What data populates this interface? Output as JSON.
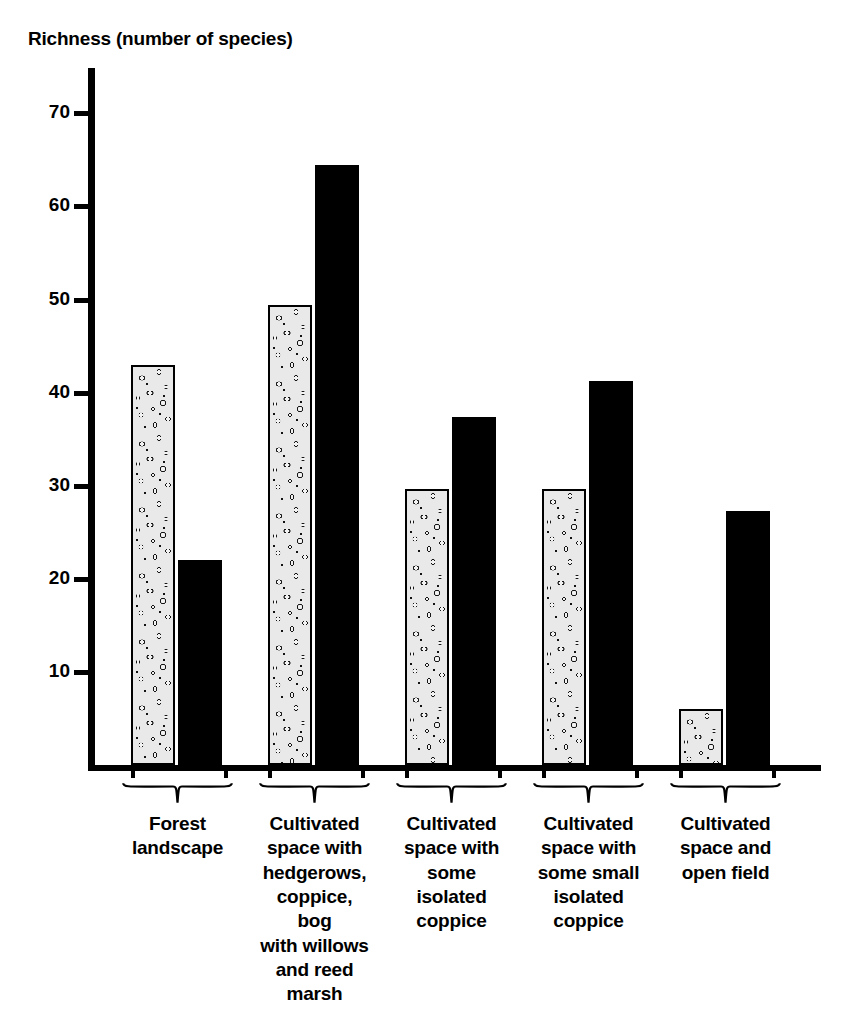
{
  "chart_data": {
    "type": "bar",
    "title": "Richness (number of species)",
    "xlabel": "",
    "ylabel": "Richness (number of species)",
    "ylim": [
      0,
      75
    ],
    "yticks": [
      10,
      20,
      30,
      40,
      50,
      60,
      70
    ],
    "grid": false,
    "legend": "none",
    "categories": [
      "Forest landscape",
      "Cultivated space with hedgerows, coppice, bog with willows and reed marsh",
      "Cultivated space with some isolated coppice",
      "Cultivated space with some small isolated coppice",
      "Cultivated space and open field"
    ],
    "category_lines": [
      [
        "Forest",
        "landscape"
      ],
      [
        "Cultivated",
        "space with",
        "hedgerows,",
        "coppice, bog",
        "with willows",
        "and reed",
        "marsh"
      ],
      [
        "Cultivated",
        "space with",
        "some",
        "isolated",
        "coppice"
      ],
      [
        "Cultivated",
        "space with",
        "some small",
        "isolated",
        "coppice"
      ],
      [
        "Cultivated",
        "space and",
        "open field"
      ]
    ],
    "series": [
      {
        "name": "stippled",
        "style": "textured",
        "values": [
          43.0,
          49.4,
          29.6,
          29.6,
          6.0
        ]
      },
      {
        "name": "solid",
        "style": "solid-black",
        "values": [
          22.0,
          64.5,
          37.4,
          41.2,
          27.3
        ]
      }
    ],
    "colors": {
      "solid": "#000000",
      "textured_fill": "#e9e9e9",
      "axis": "#000000"
    }
  },
  "axis": {
    "tick_labels": [
      "70",
      "60",
      "50",
      "40",
      "30",
      "20",
      "10"
    ]
  }
}
